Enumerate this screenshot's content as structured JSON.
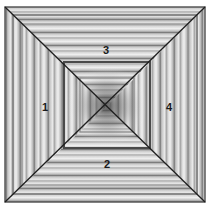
{
  "diagram": {
    "outer_square": {
      "x1": 5,
      "y1": 7,
      "x2": 205,
      "y2": 202
    },
    "center": {
      "x": 107,
      "y": 106
    },
    "inner_square": {
      "x1": 64,
      "y1": 62,
      "x2": 150,
      "y2": 148
    },
    "sections": [
      {
        "id": "left",
        "label": "1",
        "stripe_direction": "vertical",
        "label_pos": {
          "x": 45,
          "y": 107
        }
      },
      {
        "id": "bottom",
        "label": "2",
        "stripe_direction": "horizontal",
        "label_pos": {
          "x": 107,
          "y": 164
        }
      },
      {
        "id": "top",
        "label": "3",
        "stripe_direction": "horizontal",
        "label_pos": {
          "x": 106,
          "y": 50
        }
      },
      {
        "id": "right",
        "label": "4",
        "stripe_direction": "vertical",
        "label_pos": {
          "x": 169,
          "y": 107
        }
      }
    ],
    "colors": {
      "line": "#1e1e1e",
      "light": "#e6e6e6",
      "mid": "#bdbdbd",
      "dark": "#6e6e6e",
      "center_dark": "#555555"
    }
  }
}
